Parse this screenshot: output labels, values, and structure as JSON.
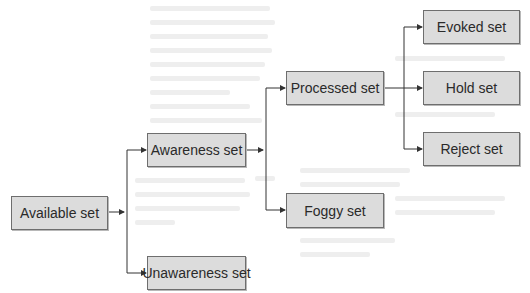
{
  "diagram": {
    "type": "tree",
    "colors": {
      "box_fill": "#dcdcdc",
      "box_border": "#6e6e6e",
      "line": "#333333",
      "text": "#2a2a2a"
    },
    "nodes": {
      "available": {
        "label": "Available set"
      },
      "awareness": {
        "label": "Awareness set"
      },
      "unawareness": {
        "label": "Unawareness set"
      },
      "processed": {
        "label": "Processed set"
      },
      "foggy": {
        "label": "Foggy set"
      },
      "evoked": {
        "label": "Evoked set"
      },
      "hold": {
        "label": "Hold set"
      },
      "reject": {
        "label": "Reject set"
      }
    },
    "edges": [
      {
        "from": "available",
        "to": "awareness"
      },
      {
        "from": "available",
        "to": "unawareness"
      },
      {
        "from": "awareness",
        "to": "processed"
      },
      {
        "from": "awareness",
        "to": "foggy"
      },
      {
        "from": "processed",
        "to": "evoked"
      },
      {
        "from": "processed",
        "to": "hold"
      },
      {
        "from": "processed",
        "to": "reject"
      }
    ]
  }
}
